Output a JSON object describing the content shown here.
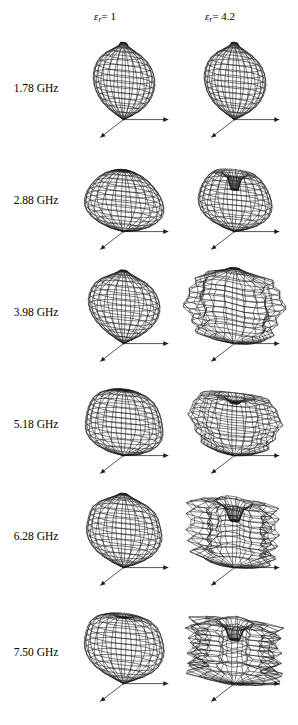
{
  "figure": {
    "columns": [
      {
        "id": "col-eps-1",
        "label_symbol": "ε",
        "label_sub": "r",
        "label_value": "= 1"
      },
      {
        "id": "col-eps-4-2",
        "label_symbol": "ε",
        "label_sub": "r",
        "label_value": "= 4.2"
      }
    ],
    "rows": [
      {
        "frequency": "1.78 GHz"
      },
      {
        "frequency": "2.88 GHz"
      },
      {
        "frequency": "3.98 GHz"
      },
      {
        "frequency": "5.18 GHz"
      },
      {
        "frequency": "6.28 GHz"
      },
      {
        "frequency": "7.50 GHz"
      }
    ]
  },
  "chart_data": {
    "type": "line",
    "xlabel": "",
    "ylabel": "",
    "grid": false,
    "legend_position": "top",
    "plot_kind": "3d-wireframe-radiation-pattern-grid",
    "rows": 6,
    "cols": 2,
    "row_labels": [
      "1.78 GHz",
      "2.88 GHz",
      "3.98 GHz",
      "5.18 GHz",
      "6.28 GHz",
      "7.50 GHz"
    ],
    "column_labels": [
      "εr = 1",
      "εr = 4.2"
    ],
    "axes_annotation": "each pattern drawn with three cartesian axis arrows from origin at pattern base: one to the right, one down-left, one vertical",
    "series": [
      {
        "name": "εr = 1",
        "permittivity": 1,
        "patterns": [
          {
            "frequency_ghz": 1.78,
            "shape": "prolate-ellipsoid",
            "lobes": 1,
            "top_null": "small",
            "width_rel": 0.62,
            "height_rel": 1.0,
            "lobe_profile": [
              0.0,
              0.3,
              0.56,
              0.74,
              0.86,
              0.94,
              0.99,
              1.0,
              0.98,
              0.92,
              0.82,
              0.66,
              0.44,
              0.16,
              0.0
            ]
          },
          {
            "frequency_ghz": 2.88,
            "shape": "rounded-teardrop",
            "lobes": 1,
            "top_null": "flat-dimple",
            "width_rel": 0.8,
            "height_rel": 0.86,
            "lobe_profile": [
              0.0,
              0.46,
              0.72,
              0.88,
              0.97,
              1.0,
              0.99,
              0.95,
              0.89,
              0.8,
              0.69,
              0.55,
              0.38,
              0.18,
              0.0
            ]
          },
          {
            "frequency_ghz": 3.98,
            "shape": "egg-teardrop",
            "lobes": 1,
            "top_null": "narrow",
            "width_rel": 0.72,
            "height_rel": 0.95,
            "lobe_profile": [
              0.0,
              0.26,
              0.5,
              0.68,
              0.82,
              0.92,
              0.98,
              1.0,
              0.99,
              0.94,
              0.86,
              0.73,
              0.53,
              0.26,
              0.0
            ]
          },
          {
            "frequency_ghz": 5.18,
            "shape": "barrel",
            "lobes": 1,
            "top_null": "flat-dimple",
            "width_rel": 0.78,
            "height_rel": 0.92,
            "lobe_profile": [
              0.0,
              0.52,
              0.78,
              0.92,
              0.99,
              1.0,
              0.99,
              0.97,
              0.94,
              0.89,
              0.82,
              0.7,
              0.52,
              0.27,
              0.0
            ]
          },
          {
            "frequency_ghz": 6.28,
            "shape": "rippled-ovoid",
            "lobes": 1,
            "top_null": "narrow-peak",
            "width_rel": 0.76,
            "height_rel": 0.96,
            "lobe_profile": [
              0.0,
              0.34,
              0.6,
              0.79,
              0.9,
              0.97,
              1.0,
              0.99,
              0.95,
              0.92,
              0.86,
              0.74,
              0.55,
              0.28,
              0.0
            ]
          },
          {
            "frequency_ghz": 7.5,
            "shape": "rippled-ovoid-notched-top",
            "lobes": 1,
            "top_null": "notch",
            "width_rel": 0.8,
            "height_rel": 0.98,
            "lobe_profile": [
              0.0,
              0.3,
              0.58,
              0.78,
              0.9,
              0.97,
              1.0,
              1.0,
              0.97,
              0.93,
              0.88,
              0.77,
              0.58,
              0.3,
              0.0
            ]
          }
        ]
      },
      {
        "name": "εr = 4.2",
        "permittivity": 4.2,
        "patterns": [
          {
            "frequency_ghz": 1.78,
            "shape": "prolate-ellipsoid",
            "lobes": 1,
            "top_null": "small",
            "width_rel": 0.62,
            "height_rel": 1.0,
            "lobe_profile": [
              0.0,
              0.3,
              0.56,
              0.74,
              0.86,
              0.94,
              0.99,
              1.0,
              0.98,
              0.92,
              0.82,
              0.66,
              0.44,
              0.16,
              0.0
            ]
          },
          {
            "frequency_ghz": 2.88,
            "shape": "ovoid-with-deep-top-null",
            "lobes": 1,
            "top_null": "deep-crater",
            "width_rel": 0.74,
            "height_rel": 0.9,
            "lobe_profile": [
              0.0,
              0.4,
              0.68,
              0.86,
              0.96,
              1.0,
              1.0,
              0.97,
              0.92,
              0.85,
              0.75,
              0.62,
              0.44,
              0.2,
              0.0
            ]
          },
          {
            "frequency_ghz": 3.98,
            "shape": "multi-lobed-side-lobes",
            "lobes": 4,
            "top_null": "cone-peak",
            "width_rel": 0.95,
            "height_rel": 0.98,
            "lobe_profile": [
              0.0,
              0.55,
              0.85,
              0.7,
              0.9,
              0.75,
              0.95,
              1.0,
              0.8,
              0.96,
              0.72,
              0.88,
              0.6,
              0.3,
              0.0
            ]
          },
          {
            "frequency_ghz": 5.18,
            "shape": "lumpy-irregular",
            "lobes": 3,
            "top_null": "crater",
            "width_rel": 0.88,
            "height_rel": 0.88,
            "lobe_profile": [
              0.0,
              0.5,
              0.8,
              0.72,
              0.92,
              0.82,
              0.98,
              1.0,
              0.88,
              0.94,
              0.78,
              0.84,
              0.58,
              0.28,
              0.0
            ]
          },
          {
            "frequency_ghz": 6.28,
            "shape": "tulip-deep-nulls",
            "lobes": 5,
            "top_null": "deep-split",
            "width_rel": 0.92,
            "height_rel": 1.0,
            "lobe_profile": [
              0.0,
              0.6,
              0.92,
              0.58,
              0.96,
              0.62,
              1.0,
              0.55,
              0.98,
              0.64,
              0.94,
              0.7,
              0.5,
              0.24,
              0.0
            ]
          },
          {
            "frequency_ghz": 7.5,
            "shape": "crown-cup-deep-center-null",
            "lobes": 6,
            "top_null": "deep-cup",
            "width_rel": 1.0,
            "height_rel": 0.94,
            "lobe_profile": [
              0.0,
              0.66,
              1.0,
              0.52,
              0.98,
              0.56,
              1.0,
              0.48,
              0.96,
              0.58,
              0.99,
              0.64,
              0.46,
              0.22,
              0.0
            ]
          }
        ]
      }
    ]
  },
  "style": {
    "line_color": "#1a1a1a",
    "cap_fill": "#101010",
    "background": "#ffffff"
  }
}
